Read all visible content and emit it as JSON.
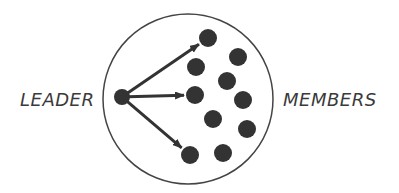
{
  "diagram": {
    "labels": {
      "leader": "LEADER",
      "members": "MEMBERS"
    },
    "colors": {
      "ink": "#333333",
      "text": "#3a3a3a",
      "background": "#ffffff"
    },
    "boundary": {
      "cx": 188,
      "cy": 99,
      "r": 85
    },
    "leader_node": {
      "cx": 122,
      "cy": 97,
      "r": 8
    },
    "member_nodes": [
      {
        "cx": 208,
        "cy": 38
      },
      {
        "cx": 238,
        "cy": 57
      },
      {
        "cx": 196,
        "cy": 67
      },
      {
        "cx": 227,
        "cy": 81
      },
      {
        "cx": 195,
        "cy": 95
      },
      {
        "cx": 243,
        "cy": 100
      },
      {
        "cx": 213,
        "cy": 119
      },
      {
        "cx": 247,
        "cy": 129
      },
      {
        "cx": 190,
        "cy": 155
      },
      {
        "cx": 223,
        "cy": 153
      }
    ],
    "member_radius": 9,
    "arrows": [
      {
        "from": "leader",
        "to_member": 0
      },
      {
        "from": "leader",
        "to_member": 4
      },
      {
        "from": "leader",
        "to_member": 8
      }
    ]
  }
}
